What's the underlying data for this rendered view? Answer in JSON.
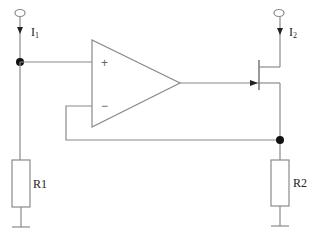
{
  "diagram": {
    "type": "circuit-schematic",
    "currents": [
      {
        "id": "I1",
        "symbol": "I",
        "subscript": "1"
      },
      {
        "id": "I2",
        "symbol": "I",
        "subscript": "2"
      }
    ],
    "opamp": {
      "plus_label": "+",
      "minus_label": "−"
    },
    "resistors": [
      {
        "id": "R1",
        "label": "R1"
      },
      {
        "id": "R2",
        "label": "R2"
      }
    ],
    "transistor": {
      "type": "FET",
      "label": ""
    },
    "colors": {
      "wire": "#8a8a8a",
      "node": "#111111",
      "background": "#ffffff"
    }
  }
}
